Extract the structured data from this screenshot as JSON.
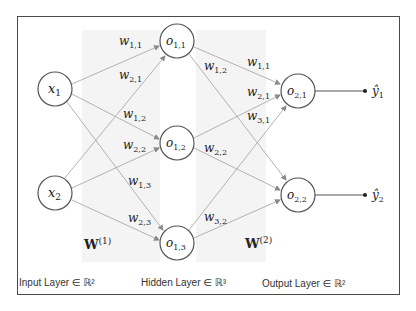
{
  "diagram": {
    "type": "neural-network",
    "colors": {
      "border": "#4a4a4a",
      "node_stroke": "#555555",
      "edge": "#a9a9a9",
      "shade": "#f3f3f3",
      "text": "#222222"
    },
    "inputs": [
      {
        "id": "x1",
        "base": "x",
        "sub": "1"
      },
      {
        "id": "x2",
        "base": "x",
        "sub": "2"
      }
    ],
    "hidden": [
      {
        "id": "o11",
        "base": "o",
        "sub": "1,1"
      },
      {
        "id": "o12",
        "base": "o",
        "sub": "1,2"
      },
      {
        "id": "o13",
        "base": "o",
        "sub": "1,3"
      }
    ],
    "outputs": [
      {
        "id": "o21",
        "base": "o",
        "sub": "2,1"
      },
      {
        "id": "o22",
        "base": "o",
        "sub": "2,2"
      }
    ],
    "predictions": [
      {
        "id": "y1",
        "base": "ŷ",
        "sub": "1"
      },
      {
        "id": "y2",
        "base": "ŷ",
        "sub": "2"
      }
    ],
    "weights_layer1": [
      {
        "base": "w",
        "sub": "1,1"
      },
      {
        "base": "w",
        "sub": "2,1"
      },
      {
        "base": "w",
        "sub": "1,2"
      },
      {
        "base": "w",
        "sub": "2,2"
      },
      {
        "base": "w",
        "sub": "1,3"
      },
      {
        "base": "w",
        "sub": "2,3"
      }
    ],
    "weights_layer2": [
      {
        "base": "w",
        "sub": "1,2"
      },
      {
        "base": "w",
        "sub": "1,1"
      },
      {
        "base": "w",
        "sub": "2,1"
      },
      {
        "base": "w",
        "sub": "3,1"
      },
      {
        "base": "w",
        "sub": "2,2"
      },
      {
        "base": "w",
        "sub": "3,2"
      }
    ],
    "matrix_labels": [
      {
        "base": "W",
        "sup": "(1)"
      },
      {
        "base": "W",
        "sup": "(2)"
      }
    ],
    "layer_labels": [
      "Input Layer ∈ ℝ²",
      "Hidden Layer ∈ ℝ³",
      "Output Layer ∈ ℝ²"
    ]
  }
}
